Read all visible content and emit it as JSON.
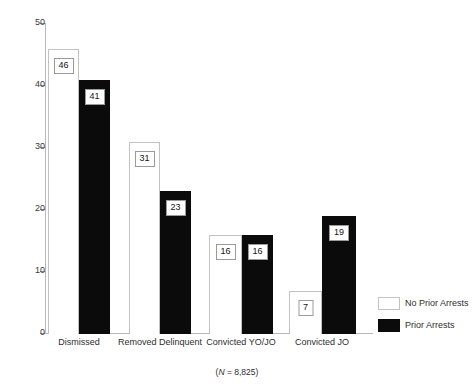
{
  "chart_data": {
    "type": "bar",
    "title": "",
    "subtitle": "",
    "xlabel": "",
    "ylabel": "",
    "ylim": [
      0,
      50
    ],
    "yticks": [
      0,
      10,
      20,
      30,
      40,
      50
    ],
    "ytick_labels": [
      "0",
      "10",
      "20",
      "30",
      "40",
      "50"
    ],
    "grid": false,
    "legend_position": "right-bottom",
    "categories": [
      "Dismissed",
      "Removed Delinquent",
      "Convicted YO/JO",
      "Convicted JO"
    ],
    "series": [
      {
        "name": "No Prior Arrests",
        "color": "#ffffff",
        "values": [
          46,
          31,
          16,
          7
        ],
        "value_labels": [
          "46",
          "31",
          "16",
          "7"
        ]
      },
      {
        "name": "Prior Arrests",
        "color": "#0b0b0b",
        "values": [
          41,
          23,
          16,
          19
        ],
        "value_labels": [
          "41",
          "23",
          "16",
          "19"
        ]
      }
    ],
    "annotations": [
      {
        "name": "sample-size",
        "text_prefix": "(",
        "text_italic": "N",
        "text_suffix": " = 8,825)"
      }
    ]
  },
  "legend": {
    "items": [
      {
        "label": "No Prior Arrests",
        "swatch": "white-swatch-icon"
      },
      {
        "label": "Prior Arrests",
        "swatch": "black-swatch-icon"
      }
    ]
  },
  "caption": {
    "prefix": "(",
    "italic": "N",
    "suffix": " = 8,825)"
  }
}
